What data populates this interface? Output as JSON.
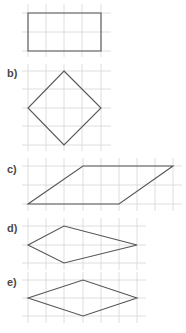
{
  "figure": {
    "colors": {
      "grid": "#d6d6d6",
      "shape": "#555555",
      "label": "#4a4a4a",
      "background": "#ffffff"
    },
    "panels": [
      {
        "id": "a",
        "label": "a)",
        "label_visible": false,
        "shape": "rectangle",
        "grid": {
          "x": [
            28,
            46,
            64,
            82,
            101
          ],
          "y": [
            13,
            32,
            51
          ],
          "x_ext": [
            22,
            111
          ],
          "y_ext": [
            4,
            57
          ]
        },
        "points": "28,13 101,13 101,51 28,51"
      },
      {
        "id": "b",
        "label": "b)",
        "label_visible": true,
        "label_pos": [
          7,
          73
        ],
        "shape": "square-diamond",
        "grid": {
          "x": [
            28,
            46,
            64,
            82,
            101
          ],
          "y": [
            71,
            89,
            108,
            126,
            145
          ],
          "x_ext": [
            22,
            111
          ],
          "y_ext": [
            64,
            151
          ]
        },
        "points": "64,71 101,108 64,145 28,108"
      },
      {
        "id": "c",
        "label": "c)",
        "label_visible": true,
        "label_pos": [
          7,
          169
        ],
        "shape": "parallelogram",
        "grid": {
          "x": [
            28,
            46,
            64,
            83,
            101,
            119,
            137,
            155,
            173
          ],
          "y": [
            166,
            185,
            204
          ],
          "x_ext": [
            22,
            182
          ],
          "y_ext": [
            158,
            211
          ]
        },
        "points": "28,204 83,166 173,166 119,204"
      },
      {
        "id": "d",
        "label": "d)",
        "label_visible": true,
        "label_pos": [
          7,
          228
        ],
        "shape": "kite",
        "grid": {
          "x": [
            28,
            46,
            64,
            83,
            101,
            119,
            137
          ],
          "y": [
            226,
            245,
            263
          ],
          "x_ext": [
            22,
            146
          ],
          "y_ext": [
            218,
            270
          ]
        },
        "points": "28,245 64,226 137,245 64,263"
      },
      {
        "id": "e",
        "label": "e)",
        "label_visible": true,
        "label_pos": [
          7,
          282
        ],
        "shape": "rhombus",
        "grid": {
          "x": [
            28,
            46,
            64,
            83,
            101,
            119,
            137
          ],
          "y": [
            280,
            298,
            316
          ],
          "x_ext": [
            22,
            146
          ],
          "y_ext": [
            272,
            323
          ]
        },
        "points": "28,298 83,280 137,298 83,316"
      }
    ]
  }
}
